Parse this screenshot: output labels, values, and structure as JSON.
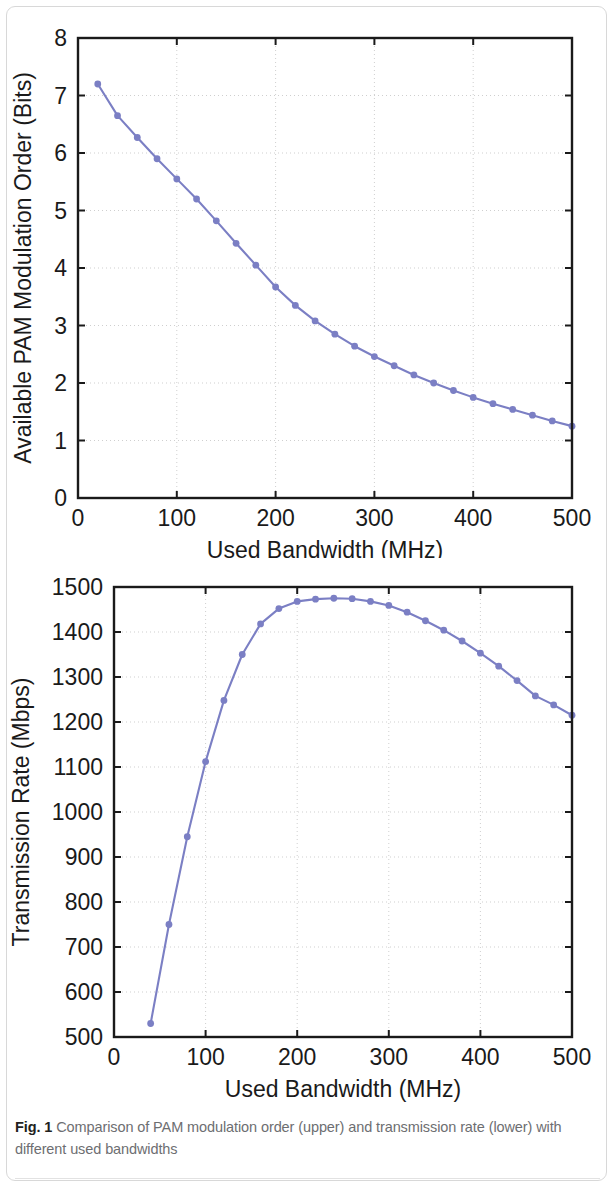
{
  "figure": {
    "caption_label": "Fig. 1",
    "caption_text": " Comparison of PAM modulation order (upper) and transmission rate (lower) with different used bandwidths"
  },
  "style": {
    "series_color": "#7b7fc4",
    "axis_color": "#1a1a1a",
    "grid_color": "#cfcfcf",
    "card_border": "#d8d8d8",
    "caption_text_color": "#6d6e71",
    "caption_label_color": "#231f20"
  },
  "chart_data": [
    {
      "id": "upper",
      "type": "line",
      "title": "",
      "xlabel": "Used Bandwidth (MHz)",
      "ylabel": "Available PAM Modulation Order (Bits)",
      "xlim": [
        0,
        500
      ],
      "ylim": [
        0,
        8
      ],
      "xticks": [
        0,
        100,
        200,
        300,
        400,
        500
      ],
      "yticks": [
        0,
        1,
        2,
        3,
        4,
        5,
        6,
        7,
        8
      ],
      "xtick_labels": [
        "0",
        "100",
        "200",
        "300",
        "400",
        "500"
      ],
      "ytick_labels": [
        "0",
        "1",
        "2",
        "3",
        "4",
        "5",
        "6",
        "7",
        "8"
      ],
      "grid": true,
      "legend": null,
      "markers": "filled-circle",
      "x": [
        20,
        40,
        60,
        80,
        100,
        120,
        140,
        160,
        180,
        200,
        220,
        240,
        260,
        280,
        300,
        320,
        340,
        360,
        380,
        400,
        420,
        440,
        460,
        480,
        500
      ],
      "values": [
        7.2,
        6.65,
        6.27,
        5.9,
        5.55,
        5.2,
        4.82,
        4.43,
        4.05,
        3.67,
        3.35,
        3.08,
        2.85,
        2.64,
        2.46,
        2.3,
        2.14,
        2.0,
        1.87,
        1.75,
        1.64,
        1.54,
        1.44,
        1.34,
        1.25
      ]
    },
    {
      "id": "lower",
      "type": "line",
      "title": "",
      "xlabel": "Used Bandwidth (MHz)",
      "ylabel": "Transmission Rate (Mbps)",
      "xlim": [
        0,
        500
      ],
      "ylim": [
        500,
        1500
      ],
      "xticks": [
        0,
        100,
        200,
        300,
        400,
        500
      ],
      "yticks": [
        500,
        600,
        700,
        800,
        900,
        1000,
        1100,
        1200,
        1300,
        1400,
        1500
      ],
      "xtick_labels": [
        "0",
        "100",
        "200",
        "300",
        "400",
        "500"
      ],
      "ytick_labels": [
        "500",
        "600",
        "700",
        "800",
        "900",
        "1000",
        "1100",
        "1200",
        "1300",
        "1400",
        "1500"
      ],
      "grid": true,
      "legend": null,
      "markers": "filled-circle",
      "x": [
        40,
        60,
        80,
        100,
        120,
        140,
        160,
        180,
        200,
        220,
        240,
        260,
        280,
        300,
        320,
        340,
        360,
        380,
        400,
        420,
        440,
        460,
        480,
        500
      ],
      "values": [
        530,
        750,
        945,
        1112,
        1248,
        1350,
        1418,
        1452,
        1468,
        1473,
        1475,
        1474,
        1468,
        1459,
        1444,
        1425,
        1404,
        1380,
        1353,
        1324,
        1292,
        1258,
        1238,
        1215
      ]
    }
  ]
}
